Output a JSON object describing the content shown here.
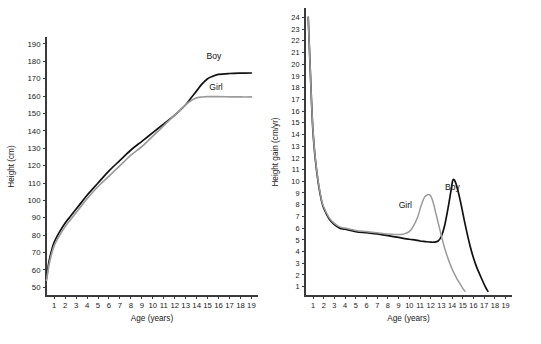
{
  "figure": {
    "background": "#ffffff",
    "panel_count": 2
  },
  "colors": {
    "boy": "#111111",
    "girl": "#9b9b9b",
    "axis": "#3a3a3a",
    "text": "#1a1a1a"
  },
  "chart_data": [
    {
      "id": "height-distance-curve",
      "type": "line",
      "title": "",
      "xlabel": "Age (years)",
      "ylabel": "Height (cm)",
      "xlim": [
        0.25,
        19.6
      ],
      "ylim": [
        45,
        194
      ],
      "grid": false,
      "legend_position": "inline-right",
      "xticks": [
        1,
        2,
        3,
        4,
        5,
        6,
        7,
        8,
        9,
        10,
        11,
        12,
        13,
        14,
        15,
        16,
        17,
        18,
        19
      ],
      "xticklabels": [
        "1",
        "2",
        "3",
        "4",
        "5",
        "6",
        "7",
        "8",
        "9",
        "10",
        "11",
        "12",
        "13",
        "14",
        "15",
        "16",
        "17",
        "18",
        "19"
      ],
      "yticks": [
        50,
        60,
        70,
        80,
        90,
        100,
        110,
        120,
        130,
        140,
        150,
        160,
        170,
        180,
        190
      ],
      "yticklabels": [
        "50",
        "60",
        "70",
        "80",
        "90",
        "100",
        "110",
        "120",
        "130",
        "140",
        "150",
        "160",
        "170",
        "180",
        "190"
      ],
      "series": [
        {
          "name": "Boy",
          "color": "#111111",
          "label_text": "Boy",
          "x": [
            0.3,
            0.5,
            0.75,
            1,
            1.5,
            2,
            2.5,
            3,
            3.5,
            4,
            5,
            6,
            7,
            8,
            9,
            10,
            11,
            12,
            13,
            13.5,
            14,
            14.5,
            15,
            15.5,
            16,
            17,
            18,
            19
          ],
          "values": [
            55,
            64,
            71,
            76,
            82,
            87,
            91,
            95,
            99,
            103,
            110,
            117,
            123,
            129,
            134,
            139,
            144,
            149,
            155,
            159,
            163,
            167,
            170,
            171.5,
            172.5,
            173,
            173.2,
            173.3
          ]
        },
        {
          "name": "Girl",
          "color": "#9b9b9b",
          "label_text": "Girl",
          "x": [
            0.3,
            0.5,
            0.75,
            1,
            1.5,
            2,
            2.5,
            3,
            3.5,
            4,
            5,
            6,
            7,
            8,
            9,
            10,
            11,
            12,
            12.5,
            13,
            13.5,
            14,
            14.5,
            15,
            16,
            17,
            18,
            19
          ],
          "values": [
            54,
            62,
            69,
            74,
            80,
            85,
            89,
            93,
            97,
            101,
            108,
            114,
            120,
            126,
            131,
            137,
            143,
            149,
            152,
            155,
            157.5,
            159,
            159.5,
            159.7,
            159.7,
            159.6,
            159.5,
            159.5
          ]
        }
      ]
    },
    {
      "id": "height-velocity-curve",
      "type": "line",
      "title": "",
      "xlabel": "Age (years)",
      "ylabel": "Height gain (cm/yr)",
      "xlim": [
        0.25,
        19.6
      ],
      "ylim": [
        0.2,
        24.8
      ],
      "grid": false,
      "legend_position": "inline",
      "xticks": [
        1,
        2,
        3,
        4,
        5,
        6,
        7,
        8,
        9,
        10,
        11,
        12,
        13,
        14,
        15,
        16,
        17,
        18,
        19
      ],
      "xticklabels": [
        "1",
        "2",
        "3",
        "4",
        "5",
        "6",
        "7",
        "8",
        "9",
        "10",
        "11",
        "12",
        "13",
        "14",
        "15",
        "16",
        "17",
        "18",
        "19"
      ],
      "yticks": [
        1,
        2,
        3,
        4,
        5,
        6,
        7,
        8,
        9,
        10,
        11,
        12,
        13,
        14,
        15,
        16,
        17,
        18,
        19,
        20,
        21,
        22,
        23,
        24
      ],
      "yticklabels": [
        "1",
        "2",
        "3",
        "4",
        "5",
        "6",
        "7",
        "8",
        "9",
        "10",
        "11",
        "12",
        "13",
        "14",
        "15",
        "16",
        "17",
        "18",
        "19",
        "20",
        "21",
        "22",
        "23",
        "24"
      ],
      "series": [
        {
          "name": "Boy",
          "color": "#111111",
          "label_text": "Boy",
          "x": [
            0.55,
            0.7,
            0.85,
            1,
            1.2,
            1.5,
            1.8,
            2,
            2.5,
            3,
            3.5,
            4,
            5,
            6,
            7,
            8,
            9,
            10,
            10.5,
            11,
            11.5,
            12,
            12.3,
            12.7,
            13,
            13.3,
            13.6,
            13.9,
            14.1,
            14.4,
            14.8,
            15.2,
            15.7,
            16.2,
            16.7,
            17.1,
            17.35
          ],
          "values": [
            24,
            20.5,
            17,
            14.2,
            12,
            9.8,
            8.3,
            7.7,
            6.8,
            6.3,
            6,
            5.9,
            5.7,
            5.6,
            5.5,
            5.35,
            5.2,
            5.05,
            5,
            4.9,
            4.85,
            4.8,
            4.8,
            4.9,
            5.3,
            6.2,
            7.6,
            9.2,
            10.15,
            9.7,
            8.2,
            6.4,
            4.4,
            2.9,
            1.8,
            1,
            0.6
          ]
        },
        {
          "name": "Girl",
          "color": "#9b9b9b",
          "label_text": "Girl",
          "x": [
            0.55,
            0.7,
            0.85,
            1,
            1.2,
            1.5,
            1.8,
            2,
            2.5,
            3,
            3.5,
            4,
            5,
            6,
            7,
            8,
            9,
            9.5,
            10,
            10.4,
            10.8,
            11.1,
            11.4,
            11.7,
            11.95,
            12.2,
            12.5,
            12.9,
            13.3,
            13.7,
            14.1,
            14.5,
            14.9,
            15.2
          ],
          "values": [
            24,
            20.5,
            17,
            14.3,
            12.1,
            9.9,
            8.4,
            7.8,
            6.9,
            6.4,
            6.1,
            6,
            5.8,
            5.7,
            5.6,
            5.5,
            5.45,
            5.5,
            5.7,
            6.2,
            7,
            7.9,
            8.6,
            8.85,
            8.8,
            8.3,
            7.2,
            5.7,
            4.3,
            3.2,
            2.3,
            1.6,
            1,
            0.6
          ]
        }
      ]
    }
  ]
}
